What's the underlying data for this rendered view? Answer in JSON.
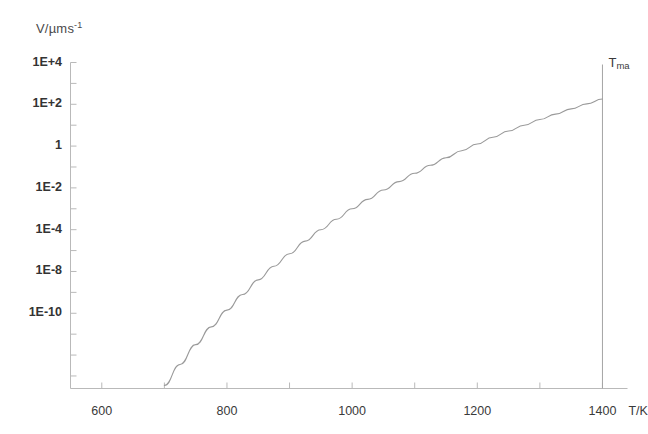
{
  "chart_data": {
    "type": "line",
    "title": "",
    "xlabel": "T/K",
    "ylabel": "V/µms⁻¹",
    "ylabel_base": "V/µms",
    "ylabel_exponent": "-1",
    "xlim": [
      550,
      1440
    ],
    "ylim_log10": [
      -11.6,
      4.0
    ],
    "grid": false,
    "legend": null,
    "xticks": [
      600,
      800,
      1000,
      1200,
      1400
    ],
    "xtick_labels": [
      "600",
      "800",
      "1000",
      "1200",
      "1400"
    ],
    "x_minor_tick_step": 100,
    "ytick_labels": [
      "1E+4",
      "1E+2",
      "1",
      "1E-2",
      "1E-4",
      "1E-8",
      "1E-10"
    ],
    "ytick_log10_positions": [
      4,
      2,
      0,
      -2,
      -4,
      -6,
      -8
    ],
    "y_minor_tick_step_log10": 1,
    "annotations": [
      {
        "name": "t-max-marker",
        "text_base": "T",
        "text_sub": "ma",
        "x": 1400,
        "type": "vertical-line-with-label"
      }
    ],
    "series": [
      {
        "name": "growth-velocity",
        "x": [
          700,
          725,
          750,
          775,
          800,
          825,
          850,
          875,
          900,
          925,
          950,
          975,
          1000,
          1025,
          1050,
          1075,
          1100,
          1125,
          1150,
          1175,
          1200,
          1225,
          1250,
          1275,
          1300,
          1325,
          1350,
          1375,
          1400
        ],
        "y_log10": [
          -11.45,
          -10.45,
          -9.5,
          -8.65,
          -7.85,
          -7.1,
          -6.4,
          -5.75,
          -5.15,
          -4.55,
          -4.0,
          -3.5,
          -3.0,
          -2.55,
          -2.1,
          -1.7,
          -1.3,
          -0.92,
          -0.56,
          -0.22,
          0.1,
          0.42,
          0.72,
          1.0,
          1.27,
          1.53,
          1.78,
          2.02,
          2.25
        ]
      }
    ]
  },
  "style": {
    "axis_color": "#b9b9b9",
    "curve_color": "#9a9a9a",
    "marker_line_color": "#a5a5a5",
    "background": "#ffffff"
  }
}
